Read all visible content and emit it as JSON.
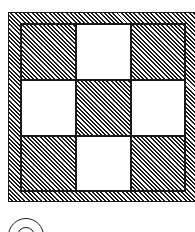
{
  "figure": {
    "type": "tiled square pattern",
    "grid": {
      "rows": 3,
      "cols": 3,
      "cells": [
        [
          "hatched",
          "white",
          "hatched"
        ],
        [
          "white",
          "hatched",
          "white"
        ],
        [
          "hatched",
          "white",
          "hatched"
        ]
      ]
    },
    "border": "hatched",
    "hatch_direction": "diagonal",
    "colors": {
      "ink": "#1a1a1a",
      "paper": "#ffffff"
    }
  },
  "option_label": {
    "shape": "circle",
    "text": ""
  }
}
